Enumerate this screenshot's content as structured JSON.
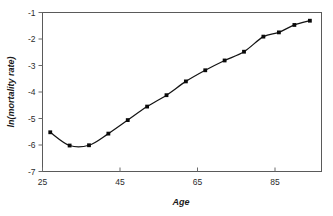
{
  "chart_data": {
    "type": "line",
    "title": "",
    "xlabel": "Age",
    "ylabel": "ln(mortality rate)",
    "xlim": [
      25,
      97
    ],
    "ylim": [
      -7,
      -1
    ],
    "xticks": [
      25,
      45,
      65,
      85
    ],
    "yticks": [
      -1,
      -2,
      -3,
      -4,
      -5,
      -6,
      -7
    ],
    "xtick_labels": [
      "25",
      "45",
      "65",
      "85"
    ],
    "ytick_labels": [
      "-1",
      "-2",
      "-3",
      "-4",
      "-5",
      "-6",
      "-7"
    ],
    "grid": false,
    "legend": false,
    "marker": "square",
    "series": [
      {
        "name": "ln(mortality rate)",
        "x": [
          27,
          32,
          37,
          42,
          47,
          52,
          57,
          62,
          67,
          72,
          77,
          79,
          82,
          85,
          88,
          91,
          94
        ],
        "values": [
          -5.52,
          -6.02,
          -6.01,
          -5.57,
          -5.06,
          -4.55,
          -4.12,
          -3.6,
          -3.18,
          -2.81,
          -2.48,
          -1.91,
          -1.9,
          -1.75,
          -1.47,
          -1.33,
          -1.31
        ]
      }
    ],
    "points": [
      {
        "age": 27,
        "ln_rate": -5.52
      },
      {
        "age": 32,
        "ln_rate": -6.02
      },
      {
        "age": 37,
        "ln_rate": -6.01
      },
      {
        "age": 42,
        "ln_rate": -5.57
      },
      {
        "age": 47,
        "ln_rate": -5.06
      },
      {
        "age": 52,
        "ln_rate": -4.55
      },
      {
        "age": 57,
        "ln_rate": -4.12
      },
      {
        "age": 62,
        "ln_rate": -3.6
      },
      {
        "age": 67,
        "ln_rate": -3.18
      },
      {
        "age": 72,
        "ln_rate": -2.81
      },
      {
        "age": 77,
        "ln_rate": -2.48
      },
      {
        "age": 82,
        "ln_rate": -1.91
      },
      {
        "age": 86,
        "ln_rate": -1.75
      },
      {
        "age": 90,
        "ln_rate": -1.47
      },
      {
        "age": 94,
        "ln_rate": -1.31
      }
    ],
    "colors": {
      "line": "#141414",
      "marker": "#0a0a0a",
      "axis": "#5a5a5a",
      "text": "#1a1a1a",
      "background": "#ffffff"
    }
  }
}
